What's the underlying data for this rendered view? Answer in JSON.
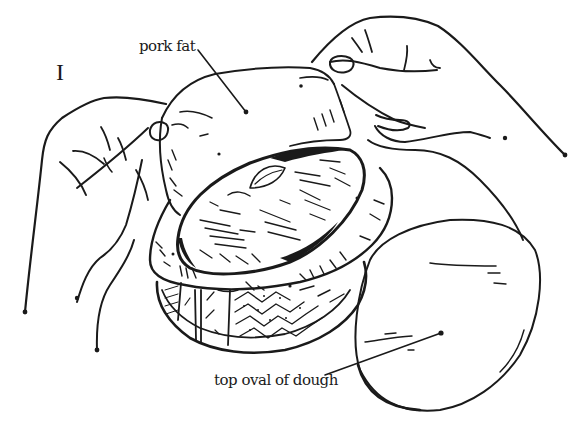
{
  "figure": {
    "step_numeral": "I",
    "labels": {
      "pork_fat": "pork fat",
      "top_oval_of_dough": "top oval of dough"
    },
    "elements": [
      "left-hand",
      "right-hand",
      "pork-fat-sheet",
      "pate-filling",
      "pastry-crust-rim",
      "decorated-oval-mold",
      "top-dough-oval"
    ],
    "colors": {
      "ink": "#1a1a1a",
      "background": "#ffffff"
    }
  }
}
